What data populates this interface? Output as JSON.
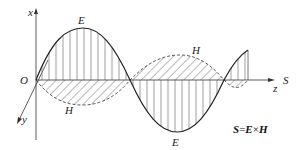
{
  "diagram": {
    "labels": {
      "x_axis": "x",
      "y_axis": "y",
      "z_axis": "z",
      "origin": "O",
      "poynting": "S",
      "e_top": "E",
      "e_bottom": "E",
      "h_top": "H",
      "h_bottom": "H"
    },
    "formula": {
      "S": "S",
      "eq": "=",
      "E": "E",
      "times": "×",
      "H": "H"
    },
    "colors": {
      "stroke": "#222222",
      "hatch": "#666666",
      "background": "#ffffff"
    }
  }
}
